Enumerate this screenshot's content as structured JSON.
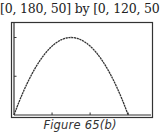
{
  "header": {
    "window_label": "[0, 180, 50] by [0, 120, 50]"
  },
  "caption": "Figure 65(b)",
  "chart_data": {
    "type": "line",
    "title": "[0, 180, 50] by [0, 120, 50]",
    "xlabel": "",
    "ylabel": "",
    "xlim": [
      0,
      180
    ],
    "ylim": [
      0,
      120
    ],
    "xscale_ticks": [
      50,
      100,
      150
    ],
    "yscale_ticks": [
      50,
      100
    ],
    "grid": false,
    "legend": null,
    "series": [
      {
        "name": "parabola",
        "x": [
          0,
          15,
          30,
          45,
          60,
          75,
          90,
          105,
          120,
          135,
          150
        ],
        "y": [
          0,
          36,
          64,
          84,
          96,
          100,
          96,
          84,
          64,
          36,
          0
        ]
      }
    ],
    "caption": "Figure 65(b)"
  },
  "colors": {
    "frame": "#333333",
    "curve": "#333333",
    "background": "#ffffff"
  }
}
